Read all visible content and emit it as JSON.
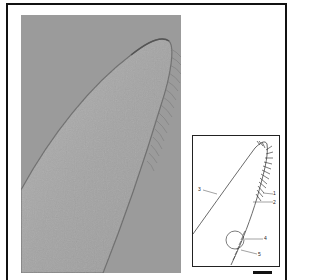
{
  "figure": {
    "type": "micrograph-with-schematic",
    "photo": {
      "description": "DIC light micrograph of an elongated ciliate anterior end",
      "background_color": "#9a9a9a",
      "cell_color": "#a8a8a8"
    },
    "drawing": {
      "description": "Line drawing of ciliate anterior end with numbered structures",
      "labels": [
        {
          "id": "1",
          "text": "1"
        },
        {
          "id": "2",
          "text": "2"
        },
        {
          "id": "3",
          "text": "3"
        },
        {
          "id": "4",
          "text": "4"
        },
        {
          "id": "5",
          "text": "5"
        }
      ]
    },
    "scale_bar": {
      "label": ""
    }
  }
}
